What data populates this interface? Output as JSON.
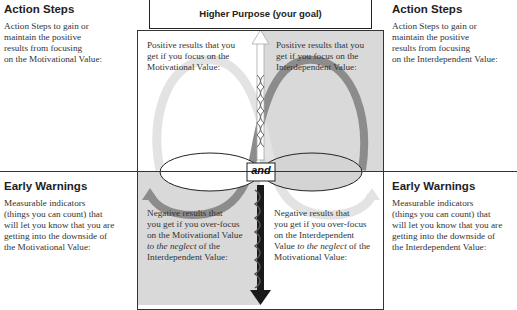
{
  "header": {
    "higher_purpose": "Higher Purpose (your goal)"
  },
  "left_panel": {
    "action_steps": {
      "title": "Action Steps",
      "lines": [
        "Action Steps to gain or",
        "maintain the positive",
        "results from focusing",
        "on the Motivational Value:"
      ]
    },
    "early_warnings": {
      "title": "Early Warnings",
      "lines": [
        "Measurable indicators",
        "(things you can count) that",
        "will let you know that you are",
        "getting into the downside of",
        "the Motivational Value:"
      ]
    }
  },
  "right_panel": {
    "action_steps": {
      "title": "Action Steps",
      "lines": [
        "Action Steps to gain or",
        "maintain the positive",
        "results from focusing",
        "on the Interdependent Value:"
      ]
    },
    "early_warnings": {
      "title": "Early Warnings",
      "lines": [
        "Measurable indicators",
        "(things you can count) that",
        "will let you know that you are",
        "getting into the downside of",
        "the Interdependent Value:"
      ]
    }
  },
  "quadrants": {
    "top_left": [
      "Positive results that you",
      "get if you focus on the",
      "Motivational Value:"
    ],
    "top_right": [
      "Positive results that you",
      "get if you focus on the",
      "Interdependent Value:"
    ],
    "bottom_left": {
      "lines": [
        "Negative results that",
        "you get if you over-focus",
        "on the Motivational Value"
      ],
      "italic": "to the neglect",
      "after_italic": " of the",
      "last": "Interdependent Value:"
    },
    "bottom_right": {
      "lines": [
        "Negative results that",
        "you get if you over-focus",
        "on the Interdependent"
      ],
      "prefix": "Value ",
      "italic": "to the neglect",
      "after_italic": " of the",
      "last": "Motivational Value:"
    }
  },
  "center": {
    "connector_label": "and",
    "left_value_label": "",
    "right_value_label": ""
  },
  "colors": {
    "gray_quadrant": "#d9d9d9",
    "light_loop": "#e6e6e6",
    "dark_loop": "#8c8c8c",
    "arrow_down": "#1a1a1a",
    "line": "#222222"
  }
}
